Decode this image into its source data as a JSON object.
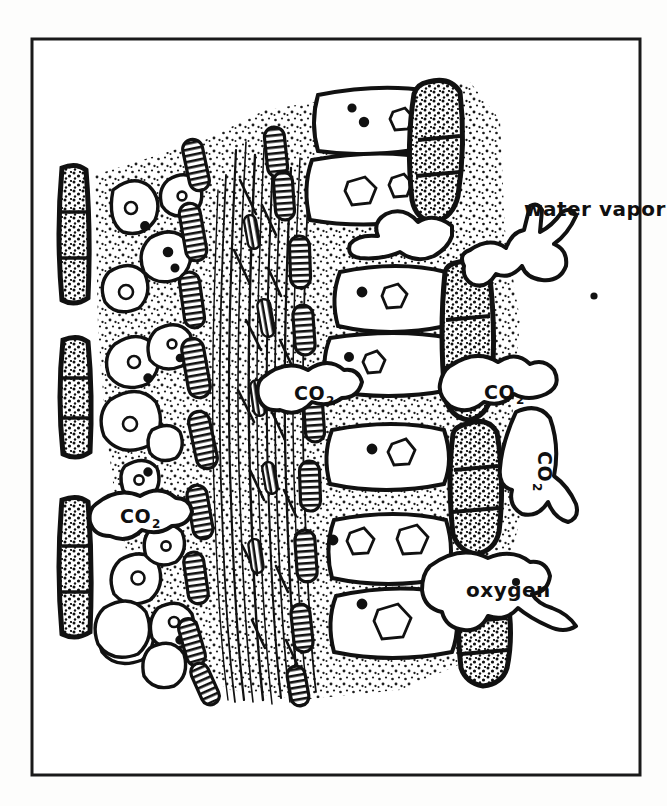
{
  "figure": {
    "kind": "line-drawing",
    "border": {
      "visible": true,
      "color": "#1a1a1a",
      "x": 32,
      "y": 39,
      "width": 608,
      "height": 736,
      "stroke_width": 3
    },
    "background_color": "#fdfdfc",
    "ink_color": "#101010",
    "paper_color": "#ffffff"
  },
  "labels": {
    "water_vapor": {
      "text": "water vapor",
      "x": 524,
      "y": 216,
      "rotation": 0,
      "font_size": 20
    },
    "oxygen": {
      "text": "oxygen",
      "x": 466,
      "y": 597,
      "rotation": 0,
      "font_size": 20
    },
    "co2_left": {
      "text": "CO",
      "subscript": "2",
      "x": 120,
      "y": 523,
      "rotation": 0,
      "font_size": 19
    },
    "co2_center": {
      "text": "CO",
      "subscript": "2",
      "x": 294,
      "y": 400,
      "rotation": 0,
      "font_size": 19
    },
    "co2_right": {
      "text": "CO",
      "subscript": "2",
      "x": 484,
      "y": 399,
      "rotation": 0,
      "font_size": 19
    },
    "co2_rotated": {
      "text": "CO",
      "subscript": "2",
      "x": 538,
      "y": 451,
      "rotation": 90,
      "font_size": 19
    }
  },
  "regions": [
    {
      "name": "left-epidermis-column",
      "description": "dark stippled epidermal guard cells along left edge"
    },
    {
      "name": "palisade-mesophyll",
      "description": "rounded cells with stippled cytoplasm on the left"
    },
    {
      "name": "chloroplast-band",
      "description": "hatched lens-shaped chloroplasts flanking the vein"
    },
    {
      "name": "vascular-vein",
      "description": "central bundle of long fibrous strands"
    },
    {
      "name": "spongy-mesophyll",
      "description": "large rounded rectangular air-space cells on the right"
    },
    {
      "name": "right-epidermis-stomata",
      "description": "dark hatched epidermal cells with stomatal pores on right edge"
    },
    {
      "name": "gas-blobs",
      "description": "amoeboid outlined gas clouds flowing out through stomata"
    }
  ]
}
